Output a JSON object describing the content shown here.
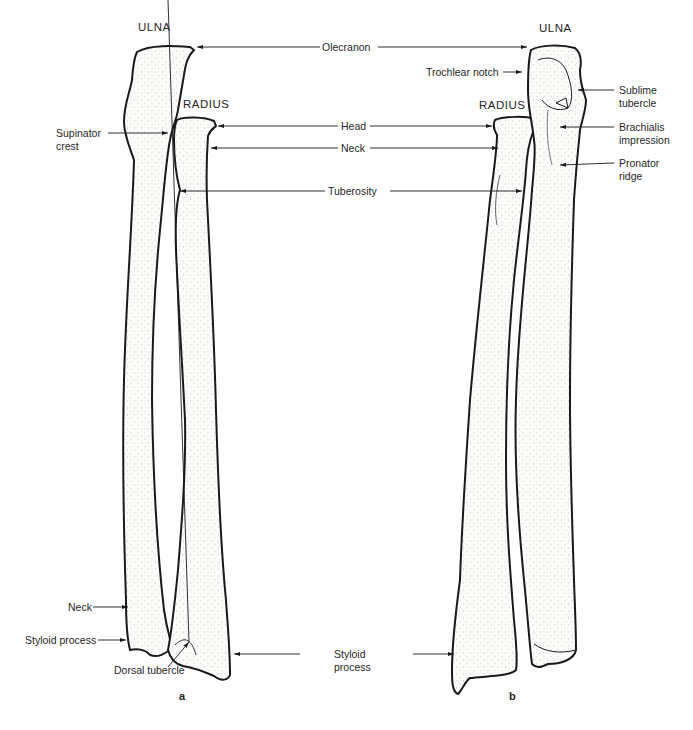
{
  "figure": {
    "panel_a": {
      "letter": "a",
      "bone_titles": {
        "ulna": "ULNA",
        "radius": "RADIUS"
      },
      "left_labels": {
        "supinator_crest": [
          "Supinator",
          "crest"
        ],
        "neck": "Neck",
        "styloid_process": "Styloid process",
        "dorsal_tubercle": "Dorsal tubercle"
      }
    },
    "panel_b": {
      "letter": "b",
      "bone_titles": {
        "ulna": "ULNA",
        "radius": "RADIUS"
      },
      "right_labels": {
        "trochlear_notch": "Trochlear notch",
        "sublime_tubercle": [
          "Sublime",
          "tubercle"
        ],
        "brachialis_impression": [
          "Brachialis",
          "impression"
        ],
        "pronator_ridge": [
          "Pronator",
          "ridge"
        ]
      }
    },
    "shared_labels": {
      "olecranon": "Olecranon",
      "head": "Head",
      "neck": "Neck",
      "tuberosity": "Tuberosity",
      "styloid_process": [
        "Styloid",
        "process"
      ]
    },
    "colors": {
      "ink": "#1a1a1a",
      "bone_fill": "#f7f7f5",
      "stipple": "#9a9a9a",
      "background": "#ffffff"
    }
  }
}
